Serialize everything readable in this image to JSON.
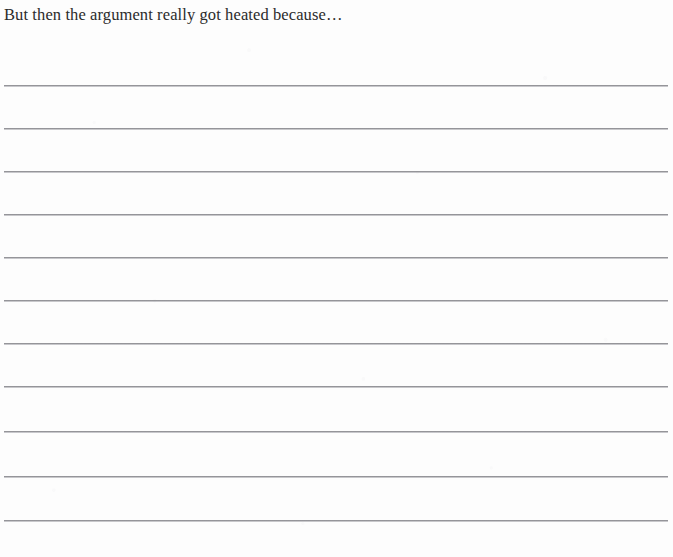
{
  "document": {
    "type": "journal-writing-prompt-page",
    "background_color": "#fdfdfd",
    "prompt": "But then the argument really got heated because…",
    "rule_line_color": "#7a7a7f",
    "rule_line_count": 11,
    "rule_line_positions": [
      85,
      128,
      171,
      214,
      257,
      300,
      343,
      386,
      431,
      476,
      520
    ],
    "rule_line_left": 4,
    "rule_line_width": 664,
    "rule_line_thickness": 2
  }
}
